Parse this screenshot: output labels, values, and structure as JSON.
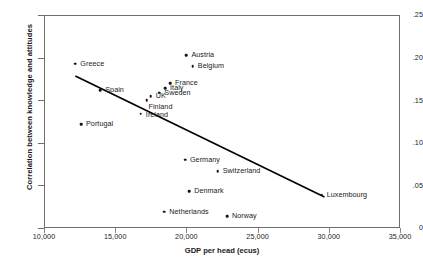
{
  "chart_data": {
    "type": "scatter",
    "title": "",
    "xlabel": "GDP per head (ecus)",
    "ylabel": "Correlation between knowledge and attitudes",
    "xlim": [
      10000,
      35000
    ],
    "ylim": [
      0,
      0.25
    ],
    "xticks": [
      "10,000",
      "15,000",
      "20,000",
      "25,000",
      "30,000",
      "35,000"
    ],
    "xtick_values": [
      10000,
      15000,
      20000,
      25000,
      30000,
      35000
    ],
    "yticks": [
      "0",
      ".05",
      ".10",
      ".15",
      ".20",
      ".25"
    ],
    "ytick_values": [
      0,
      0.05,
      0.1,
      0.15,
      0.2,
      0.25
    ],
    "grid": false,
    "legend": "none",
    "marker_color": "#141414",
    "trendline_color": "#000000",
    "frame_color": "#6e6e6e",
    "points": [
      {
        "label": "Greece",
        "x": 12200,
        "y": 0.193,
        "label_dx": 5,
        "label_dy": 0
      },
      {
        "label": "Spain",
        "x": 13950,
        "y": 0.162,
        "label_dx": 5,
        "label_dy": 0
      },
      {
        "label": "Portugal",
        "x": 12600,
        "y": 0.122,
        "label_dx": 5,
        "label_dy": 0
      },
      {
        "label": "Austria",
        "x": 20000,
        "y": 0.203,
        "label_dx": 5,
        "label_dy": 0
      },
      {
        "label": "Belgium",
        "x": 20450,
        "y": 0.19,
        "label_dx": 5,
        "label_dy": 0
      },
      {
        "label": "France",
        "x": 18850,
        "y": 0.17,
        "label_dx": 5,
        "label_dy": 0
      },
      {
        "label": "Italy",
        "x": 18500,
        "y": 0.164,
        "label_dx": 5,
        "label_dy": 0
      },
      {
        "label": "Sweden",
        "x": 18100,
        "y": 0.159,
        "label_dx": 5,
        "label_dy": 0
      },
      {
        "label": "UK",
        "x": 17500,
        "y": 0.155,
        "label_dx": 5,
        "label_dy": 0
      },
      {
        "label": "Finland",
        "x": 17200,
        "y": 0.15,
        "label_dx": 2,
        "label_dy": 7
      },
      {
        "label": "Ireland",
        "x": 16800,
        "y": 0.134,
        "label_dx": 5,
        "label_dy": 1
      },
      {
        "label": "Germany",
        "x": 19900,
        "y": 0.08,
        "label_dx": 5,
        "label_dy": 0
      },
      {
        "label": "Switzerland",
        "x": 22200,
        "y": 0.067,
        "label_dx": 5,
        "label_dy": 0
      },
      {
        "label": "Denmark",
        "x": 20200,
        "y": 0.043,
        "label_dx": 5,
        "label_dy": 0
      },
      {
        "label": "Netherlands",
        "x": 18450,
        "y": 0.019,
        "label_dx": 5,
        "label_dy": 0
      },
      {
        "label": "Norway",
        "x": 22850,
        "y": 0.014,
        "label_dx": 5,
        "label_dy": 0
      },
      {
        "label": "Luxembourg",
        "x": 29500,
        "y": 0.039,
        "label_dx": 5,
        "label_dy": 0
      }
    ],
    "trendline": {
      "x1": 12200,
      "y1": 0.1785,
      "x2": 29700,
      "y2": 0.0365
    }
  }
}
